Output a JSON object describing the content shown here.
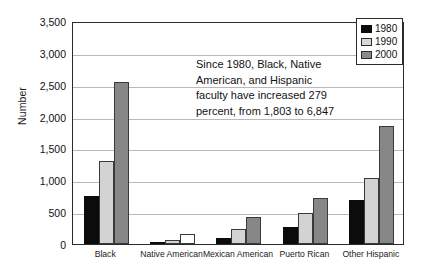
{
  "chart_data": {
    "type": "bar",
    "title": "",
    "xlabel": "",
    "ylabel": "Number",
    "ylim": [
      0,
      3500
    ],
    "ytick_step": 500,
    "grid": true,
    "legend_position": "top-right",
    "categories": [
      "Black",
      "Native American",
      "Mexican American",
      "Puerto Rican",
      "Other Hispanic"
    ],
    "ytick_labels": [
      "3,500",
      "3,000",
      "2,500",
      "2,000",
      "1,500",
      "1,000",
      "500",
      "0"
    ],
    "ytick_values": [
      3500,
      3000,
      2500,
      2000,
      1500,
      1000,
      500,
      0
    ],
    "series": [
      {
        "name": "1980",
        "color": "#0c0c0c",
        "values": [
          750,
          30,
          100,
          270,
          690
        ]
      },
      {
        "name": "1990",
        "color": "#d3d3d3",
        "values": [
          1300,
          70,
          230,
          490,
          1040
        ]
      },
      {
        "name": "2000",
        "color": "#878787",
        "values": [
          2540,
          155,
          420,
          730,
          1850
        ]
      }
    ],
    "annotation": {
      "lines": [
        "Since 1980, Black, Native",
        "American, and Hispanic",
        "faculty have increased 279",
        "percent, from 1,803 to 6,847"
      ]
    }
  },
  "legend": {
    "items": [
      {
        "label": "1980"
      },
      {
        "label": "1990"
      },
      {
        "label": "2000"
      }
    ]
  }
}
